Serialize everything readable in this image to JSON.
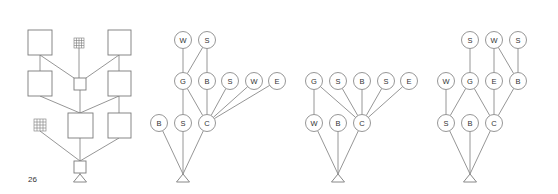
{
  "figure_number": "26",
  "colors": {
    "stroke": "#8a8a8a",
    "text": "#333333",
    "background": "#ffffff"
  },
  "panels": [
    {
      "id": "panel-1-boxes",
      "nodes": [
        {
          "id": "t1",
          "type": "box",
          "x": 28,
          "y": 30,
          "w": 24,
          "h": 25
        },
        {
          "id": "t2",
          "type": "grid",
          "x": 74,
          "y": 38,
          "w": 10,
          "h": 10
        },
        {
          "id": "t3",
          "type": "box",
          "x": 108,
          "y": 30,
          "w": 23,
          "h": 25
        },
        {
          "id": "m1",
          "type": "box",
          "x": 28,
          "y": 71,
          "w": 24,
          "h": 25
        },
        {
          "id": "m2",
          "type": "box",
          "x": 74,
          "y": 78,
          "w": 12,
          "h": 12
        },
        {
          "id": "m3",
          "type": "box",
          "x": 108,
          "y": 71,
          "w": 23,
          "h": 25
        },
        {
          "id": "b0",
          "type": "grid",
          "x": 34,
          "y": 119,
          "w": 12,
          "h": 12
        },
        {
          "id": "b1",
          "type": "box",
          "x": 68,
          "y": 113,
          "w": 25,
          "h": 25
        },
        {
          "id": "b2",
          "type": "box",
          "x": 108,
          "y": 113,
          "w": 23,
          "h": 25
        },
        {
          "id": "r",
          "type": "box",
          "x": 74,
          "y": 161,
          "w": 12,
          "h": 12
        }
      ],
      "edges": [
        [
          40,
          55,
          40,
          71
        ],
        [
          79,
          48,
          79,
          78
        ],
        [
          119,
          55,
          119,
          71
        ],
        [
          40,
          55,
          74,
          78
        ],
        [
          119,
          55,
          86,
          78
        ],
        [
          40,
          96,
          80,
          113
        ],
        [
          80,
          90,
          80,
          113
        ],
        [
          119,
          96,
          80,
          113
        ],
        [
          119,
          96,
          119,
          113
        ],
        [
          40,
          131,
          80,
          161
        ],
        [
          80,
          138,
          80,
          161
        ],
        [
          119,
          138,
          80,
          161
        ]
      ],
      "root": {
        "x": 80,
        "y": 174
      }
    },
    {
      "id": "panel-2",
      "nodes": [
        {
          "label": "W",
          "x": 183,
          "y": 40
        },
        {
          "label": "S",
          "x": 207,
          "y": 40
        },
        {
          "label": "G",
          "x": 183,
          "y": 81
        },
        {
          "label": "B",
          "x": 207,
          "y": 81
        },
        {
          "label": "S",
          "x": 230,
          "y": 81
        },
        {
          "label": "W",
          "x": 254,
          "y": 81
        },
        {
          "label": "E",
          "x": 277,
          "y": 81
        },
        {
          "label": "B",
          "x": 159,
          "y": 123
        },
        {
          "label": "S",
          "x": 183,
          "y": 123
        },
        {
          "label": "C",
          "x": 207,
          "y": 123
        }
      ],
      "edges": [
        [
          0,
          2
        ],
        [
          1,
          2
        ],
        [
          1,
          3
        ],
        [
          2,
          8
        ],
        [
          2,
          9
        ],
        [
          3,
          9
        ],
        [
          4,
          9
        ],
        [
          5,
          9
        ],
        [
          6,
          9
        ]
      ],
      "root": {
        "x": 183,
        "y": 174
      },
      "root_edges": [
        7,
        8,
        9
      ]
    },
    {
      "id": "panel-3",
      "nodes": [
        {
          "label": "G",
          "x": 314,
          "y": 81
        },
        {
          "label": "S",
          "x": 338,
          "y": 81
        },
        {
          "label": "B",
          "x": 362,
          "y": 81
        },
        {
          "label": "S",
          "x": 386,
          "y": 81
        },
        {
          "label": "E",
          "x": 409,
          "y": 81
        },
        {
          "label": "W",
          "x": 314,
          "y": 123
        },
        {
          "label": "B",
          "x": 338,
          "y": 123
        },
        {
          "label": "C",
          "x": 362,
          "y": 123
        }
      ],
      "edges": [
        [
          0,
          5
        ],
        [
          0,
          7
        ],
        [
          1,
          7
        ],
        [
          2,
          7
        ],
        [
          3,
          7
        ],
        [
          4,
          7
        ]
      ],
      "root": {
        "x": 338,
        "y": 174
      },
      "root_edges": [
        5,
        6,
        7
      ]
    },
    {
      "id": "panel-4",
      "nodes": [
        {
          "label": "S",
          "x": 470,
          "y": 40
        },
        {
          "label": "W",
          "x": 494,
          "y": 40
        },
        {
          "label": "S",
          "x": 518,
          "y": 40
        },
        {
          "label": "W",
          "x": 446,
          "y": 81
        },
        {
          "label": "G",
          "x": 470,
          "y": 81
        },
        {
          "label": "E",
          "x": 494,
          "y": 81
        },
        {
          "label": "B",
          "x": 518,
          "y": 81
        },
        {
          "label": "S",
          "x": 446,
          "y": 123
        },
        {
          "label": "B",
          "x": 470,
          "y": 123
        },
        {
          "label": "C",
          "x": 494,
          "y": 123
        }
      ],
      "edges": [
        [
          0,
          4
        ],
        [
          1,
          5
        ],
        [
          1,
          6
        ],
        [
          2,
          6
        ],
        [
          3,
          7
        ],
        [
          4,
          7
        ],
        [
          4,
          9
        ],
        [
          5,
          9
        ],
        [
          6,
          9
        ]
      ],
      "root": {
        "x": 470,
        "y": 174
      },
      "root_edges": [
        7,
        8,
        9
      ]
    }
  ]
}
